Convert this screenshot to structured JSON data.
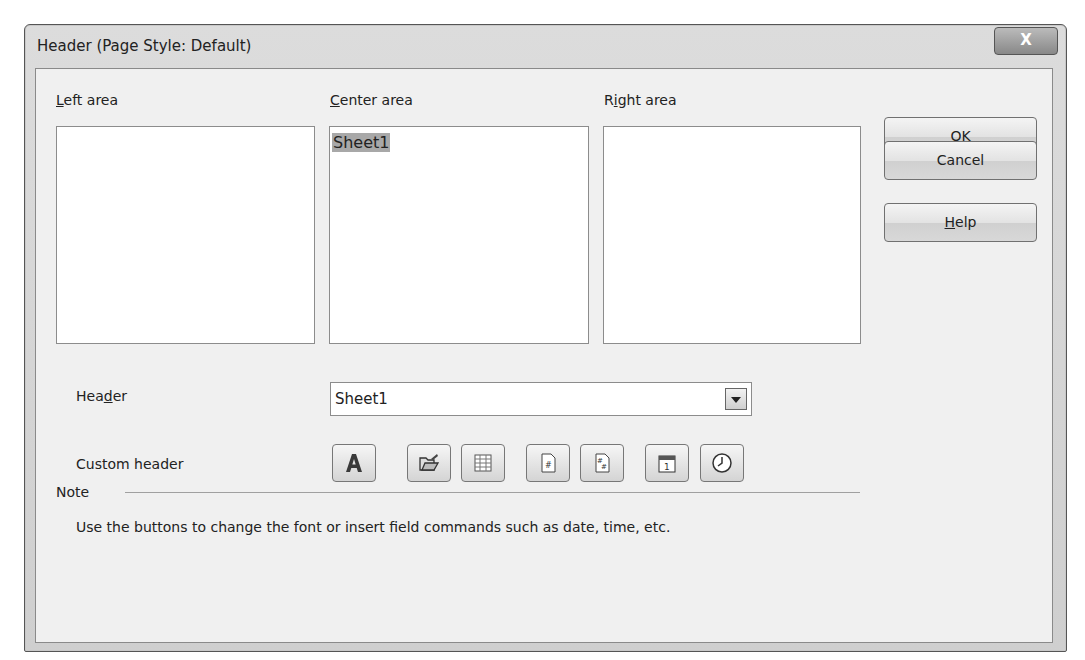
{
  "window": {
    "title": "Header (Page Style: Default)",
    "close_label": "X"
  },
  "areas": {
    "left": {
      "label": "Left area",
      "mnemonic": "L",
      "content": ""
    },
    "center": {
      "label": "Center area",
      "mnemonic": "C",
      "content": "Sheet1",
      "content_selected": true
    },
    "right": {
      "label": "Right area",
      "mnemonic": "i",
      "content": ""
    }
  },
  "buttons": {
    "ok": "OK",
    "cancel": "Cancel",
    "help": "Help"
  },
  "header_select": {
    "label": "Header",
    "value": "Sheet1"
  },
  "custom_header": {
    "label": "Custom header",
    "tools": [
      {
        "name": "text-attributes",
        "icon": "font-A-icon"
      },
      {
        "name": "title",
        "icon": "folder-icon"
      },
      {
        "name": "sheet-name",
        "icon": "table-icon"
      },
      {
        "name": "page",
        "icon": "page-number-icon"
      },
      {
        "name": "pages",
        "icon": "page-count-icon"
      },
      {
        "name": "date",
        "icon": "calendar-icon"
      },
      {
        "name": "time",
        "icon": "clock-icon"
      }
    ]
  },
  "note": {
    "title": "Note",
    "text": "Use the buttons to change the font or insert field commands such as date, time, etc."
  }
}
